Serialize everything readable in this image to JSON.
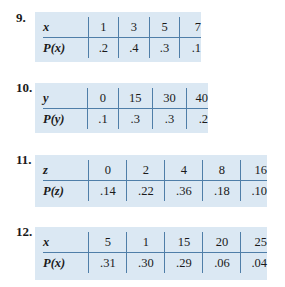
{
  "problems": [
    {
      "number": "9.",
      "var_label": "x",
      "prob_label": "P(x)",
      "values": [
        "1",
        "3",
        "5",
        "7"
      ],
      "probabilities": [
        ".2",
        ".4",
        ".3",
        ".1"
      ]
    },
    {
      "number": "10.",
      "var_label": "y",
      "prob_label": "P(y)",
      "values": [
        "0",
        "15",
        "30",
        "40"
      ],
      "probabilities": [
        ".1",
        ".3",
        ".3",
        ".2"
      ]
    },
    {
      "number": "11.",
      "var_label": "z",
      "prob_label": "P(z)",
      "values": [
        "0",
        "2",
        "4",
        "8",
        "16"
      ],
      "probabilities": [
        ".14",
        ".22",
        ".36",
        ".18",
        ".10"
      ]
    },
    {
      "number": "12.",
      "var_label": "x",
      "prob_label": "P(x)",
      "values": [
        "5",
        "1",
        "15",
        "20",
        "25"
      ],
      "probabilities": [
        ".31",
        ".30",
        ".29",
        ".06",
        ".04"
      ]
    }
  ],
  "colors": {
    "table_background": "#dbe8f3",
    "rule_color": "#4f7ea8"
  }
}
